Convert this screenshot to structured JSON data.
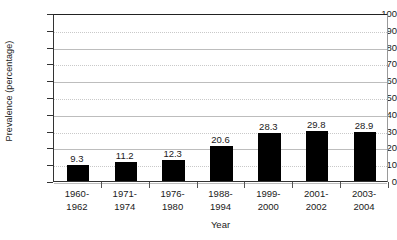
{
  "chart_data": {
    "type": "bar",
    "title": "",
    "xlabel": "Year",
    "ylabel": "Prevalence (percentage)",
    "categories": [
      "1960-\n1962",
      "1971-\n1974",
      "1976-\n1980",
      "1988-\n1994",
      "1999-\n2000",
      "2001-\n2002",
      "2003-\n2004"
    ],
    "category_lines": [
      [
        "1960-",
        "1962"
      ],
      [
        "1971-",
        "1974"
      ],
      [
        "1976-",
        "1980"
      ],
      [
        "1988-",
        "1994"
      ],
      [
        "1999-",
        "2000"
      ],
      [
        "2001-",
        "2002"
      ],
      [
        "2003-",
        "2004"
      ]
    ],
    "values": [
      9.3,
      11.2,
      12.3,
      20.6,
      28.3,
      29.8,
      28.9
    ],
    "value_labels": [
      "9.3",
      "11.2",
      "12.3",
      "20.6",
      "28.3",
      "29.8",
      "28.9"
    ],
    "ylim": [
      0,
      100
    ],
    "ytick_step": 10,
    "ytick_labels": [
      "0",
      "10",
      "20",
      "30",
      "40",
      "50",
      "60",
      "70",
      "80",
      "90",
      "100"
    ],
    "grid": true,
    "legend": "none",
    "bar_color": "#000000",
    "grid_color": "#bdbdbd",
    "axis_color": "#333333",
    "background_color": "#ffffff"
  }
}
